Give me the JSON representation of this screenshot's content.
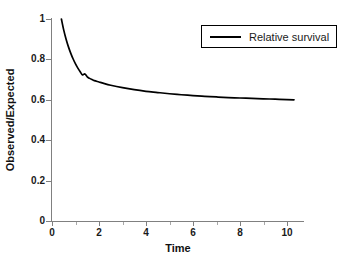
{
  "chart_data": {
    "type": "line",
    "title": "",
    "xlabel": "Time",
    "ylabel": "Observed/Expected",
    "xlim": [
      0,
      10.64
    ],
    "ylim": [
      0,
      1
    ],
    "grid": false,
    "legend_position": "top-right",
    "x_ticks": [
      0,
      2,
      4,
      6,
      8,
      10
    ],
    "x_tick_labels": [
      "0",
      "2",
      "4",
      "6",
      "8",
      "10"
    ],
    "x_minor_ticks": [
      1,
      3,
      5,
      7,
      9
    ],
    "y_ticks": [
      0,
      0.2,
      0.4,
      0.6,
      0.8,
      1
    ],
    "y_tick_labels": [
      "0",
      "0.2",
      "0.4",
      "0.6",
      "0.8",
      "1"
    ],
    "series": [
      {
        "name": "Relative survival",
        "color": "#000000",
        "x": [
          0.4,
          0.5,
          0.6,
          0.7,
          0.8,
          0.9,
          1.0,
          1.1,
          1.2,
          1.3,
          1.4,
          1.5,
          1.6,
          1.7,
          1.8,
          2.0,
          2.2,
          2.5,
          3.0,
          3.5,
          4.0,
          4.5,
          5.0,
          5.5,
          6.0,
          6.5,
          7.0,
          7.5,
          8.0,
          8.5,
          9.0,
          9.5,
          10.0,
          10.3
        ],
        "y": [
          1.0,
          0.945,
          0.9,
          0.862,
          0.83,
          0.802,
          0.778,
          0.757,
          0.739,
          0.723,
          0.728,
          0.714,
          0.706,
          0.7,
          0.695,
          0.688,
          0.681,
          0.672,
          0.66,
          0.65,
          0.642,
          0.636,
          0.63,
          0.625,
          0.621,
          0.617,
          0.614,
          0.611,
          0.609,
          0.607,
          0.605,
          0.603,
          0.601,
          0.6
        ]
      }
    ]
  },
  "legend": {
    "entries": [
      {
        "label": "Relative survival"
      }
    ]
  },
  "axes": {
    "y_title": "Observed/Expected",
    "x_title": "Time"
  }
}
